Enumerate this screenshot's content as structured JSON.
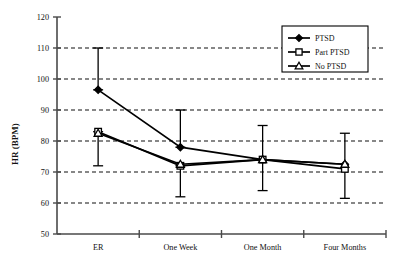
{
  "chart_data": {
    "type": "line",
    "title": "",
    "xlabel": "",
    "ylabel": "HR (BPM)",
    "categories": [
      "ER",
      "One Week",
      "One Month",
      "Four Months"
    ],
    "ylim": [
      50,
      120
    ],
    "ytick_step": 10,
    "yticks": [
      "50",
      "60",
      "70",
      "80",
      "90",
      "100",
      "110",
      "120"
    ],
    "grid": "horizontal-dashed",
    "legend_position": "top-right",
    "series": [
      {
        "name": "PTSD",
        "marker": "diamond",
        "values": [
          96.5,
          78.0,
          74.0,
          72.5
        ],
        "err_low": [
          null,
          null,
          null,
          null
        ],
        "err_high": [
          null,
          null,
          null,
          null
        ]
      },
      {
        "name": "Part PTSD",
        "marker": "square",
        "values": [
          83.0,
          72.0,
          74.0,
          71.0
        ],
        "err_low": [
          null,
          null,
          null,
          null
        ],
        "err_high": [
          null,
          null,
          null,
          null
        ]
      },
      {
        "name": "No PTSD",
        "marker": "triangle",
        "values": [
          82.5,
          72.5,
          74.0,
          72.5
        ],
        "err_low": [
          null,
          null,
          null,
          null
        ],
        "err_high": [
          null,
          null,
          null,
          null
        ]
      }
    ],
    "error_bars": [
      {
        "category": "ER",
        "upper": 110.0,
        "lower": 96.5,
        "attached_to": "PTSD"
      },
      {
        "category": "ER",
        "upper": 83.0,
        "lower": 72.0,
        "attached_to": "Part PTSD"
      },
      {
        "category": "One Week",
        "upper": 90.0,
        "lower": 78.0,
        "attached_to": "PTSD"
      },
      {
        "category": "One Week",
        "upper": 72.0,
        "lower": 62.0,
        "attached_to": "Part PTSD"
      },
      {
        "category": "One Month",
        "upper": 85.0,
        "lower": 64.0,
        "attached_to": "PTSD"
      },
      {
        "category": "Four Months",
        "upper": 82.5,
        "lower": 61.5,
        "attached_to": "PTSD"
      }
    ]
  },
  "axes": {
    "y_title": "HR (BPM)"
  },
  "legend": {
    "entries": [
      {
        "label": "PTSD",
        "marker": "diamond"
      },
      {
        "label": "Part PTSD",
        "marker": "square"
      },
      {
        "label": "No PTSD",
        "marker": "triangle"
      }
    ]
  },
  "colors": {
    "line": "#000000",
    "grid": "#111111",
    "axis": "#4a4a4a",
    "background": "#ffffff"
  }
}
